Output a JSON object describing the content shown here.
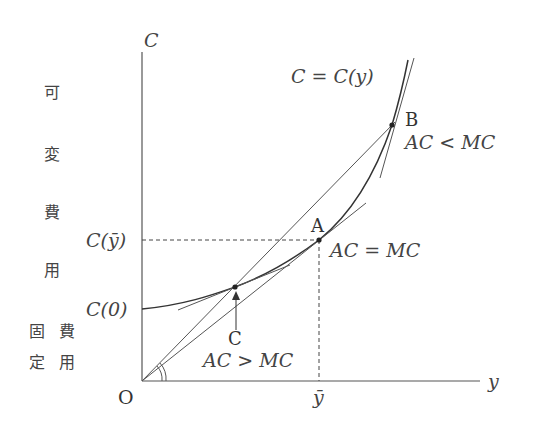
{
  "diagram": {
    "type": "cost-curve",
    "axes": {
      "y_label": "C",
      "x_label": "y",
      "origin_label": "O"
    },
    "left_labels": {
      "variable_cost": [
        "可",
        "変",
        "費",
        "用"
      ],
      "fixed_cost_col1": [
        "固",
        "定"
      ],
      "fixed_cost_col2": [
        "費",
        "用"
      ]
    },
    "tick_labels": {
      "c_ybar": "C(ȳ)",
      "c_zero": "C(0)",
      "ybar": "ȳ"
    },
    "curve_label": "C = C(y)",
    "points": [
      {
        "id": "A",
        "label": "A",
        "condition": "AC = MC"
      },
      {
        "id": "B",
        "label": "B",
        "condition": "AC < MC"
      },
      {
        "id": "C",
        "label": "C",
        "condition": "AC > MC"
      }
    ],
    "colors": {
      "line": "#444444",
      "text": "#333333",
      "background": "#ffffff"
    }
  }
}
